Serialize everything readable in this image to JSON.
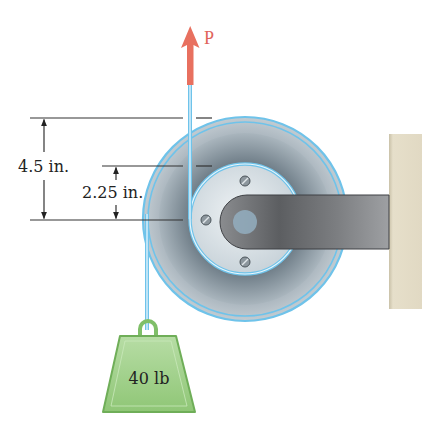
{
  "figure": {
    "force_label": "P",
    "outer_dimension": "4.5 in.",
    "inner_dimension": "2.25 in.",
    "weight_label": "40 lb"
  },
  "colors": {
    "force_arrow": "#e8705f",
    "rope": "#6fc3ea",
    "pulley_outer": "#b9c3ca",
    "pulley_groove": "#7f8e99",
    "pulley_hub": "#d6dee4",
    "arm": "#6b6d70",
    "wall": "#e3dcc6",
    "weight": "#9ccf86",
    "dimension_line": "#333333"
  },
  "icons": {
    "force": "arrow-up",
    "weight": "kettlebell-weight"
  }
}
